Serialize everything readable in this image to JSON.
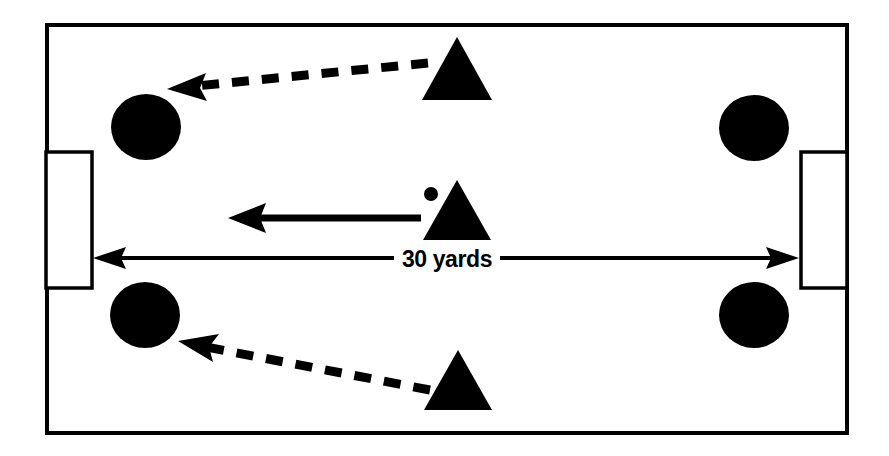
{
  "diagram": {
    "type": "soccer-drill-diagram",
    "colors": {
      "ink": "#000000",
      "field": "#ffffff",
      "background": "#ffffff"
    },
    "dimension": {
      "label": "30 yards",
      "value": 30,
      "unit": "yards",
      "orientation": "horizontal",
      "start_x": 95,
      "end_x": 797,
      "y": 258
    },
    "field": {
      "name": "playing-area",
      "x": 47,
      "y": 25,
      "width": 800,
      "height": 408,
      "stroke_width": 4
    },
    "goals": [
      {
        "name": "goal-left",
        "side": "left",
        "x": 46,
        "y": 152,
        "width": 46,
        "height": 136,
        "stroke_width": 3
      },
      {
        "name": "goal-right",
        "side": "right",
        "x": 801,
        "y": 152,
        "width": 46,
        "height": 136,
        "stroke_width": 3
      }
    ],
    "circles": [
      {
        "name": "marker-top-left",
        "cx": 146,
        "cy": 127,
        "rx": 35,
        "ry": 33
      },
      {
        "name": "marker-top-right",
        "cx": 754,
        "cy": 128,
        "rx": 35,
        "ry": 33
      },
      {
        "name": "marker-bottom-left",
        "cx": 145,
        "cy": 315,
        "rx": 35,
        "ry": 33
      },
      {
        "name": "marker-bottom-right",
        "cx": 754,
        "cy": 315,
        "rx": 35,
        "ry": 33
      }
    ],
    "triangles": [
      {
        "name": "player-top",
        "cx": 457,
        "apex_y": 37,
        "base_y": 100,
        "half_width": 35
      },
      {
        "name": "player-middle",
        "cx": 457,
        "apex_y": 180,
        "base_y": 240,
        "half_width": 34
      },
      {
        "name": "player-bottom",
        "cx": 458,
        "apex_y": 350,
        "base_y": 410,
        "half_width": 34
      }
    ],
    "ball": {
      "name": "ball-marker",
      "cx": 431,
      "cy": 194,
      "rx": 7,
      "ry": 7
    },
    "arrows": [
      {
        "name": "run-arrow-top",
        "style": "dashed",
        "from_x": 428,
        "from_y": 63,
        "to_x": 172,
        "to_y": 88,
        "stroke_width": 9,
        "dash": "18 13"
      },
      {
        "name": "pass-arrow-middle",
        "style": "solid",
        "from_x": 421,
        "from_y": 218,
        "to_x": 229,
        "to_y": 218,
        "stroke_width": 7
      },
      {
        "name": "run-arrow-bottom",
        "style": "dashed",
        "from_x": 430,
        "from_y": 390,
        "to_x": 180,
        "to_y": 341,
        "stroke_width": 9,
        "dash": "18 13"
      }
    ]
  }
}
